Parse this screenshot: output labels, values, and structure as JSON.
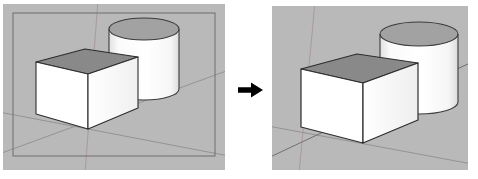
{
  "figure": {
    "kind": "before-after-comparison",
    "arrow_glyph": "→",
    "arrow_label": "right-arrow",
    "arrow_color": "#000000"
  },
  "panels": [
    {
      "id": "before",
      "label": "before",
      "caption": "",
      "background_color": "#b9b9b9",
      "has_perspective_frame": true,
      "frame_color": "#6e6e6e",
      "scene": {
        "axis_lines": [
          {
            "name": "vertical-blue-axis",
            "color": "#a39098"
          },
          {
            "name": "ground-red-axis",
            "color": "#8d8d8d"
          },
          {
            "name": "ground-green-axis",
            "color": "#8d8d8d"
          }
        ],
        "objects": [
          {
            "name": "cylinder",
            "top_face_color": "#a0a0a0",
            "side_face_color": "#fdfdfd",
            "edge_color": "#3a3a3a"
          },
          {
            "name": "box",
            "top_face_color": "#8a8a8a",
            "front_face_color": "#ffffff",
            "side_face_color": "#f2f2f2",
            "edge_color": "#2e2e2e"
          }
        ]
      }
    },
    {
      "id": "after",
      "label": "after",
      "caption": "",
      "background_color": "#b9b9b9",
      "has_perspective_frame": false,
      "frame_color": "#6e6e6e",
      "scene": {
        "axis_lines": [
          {
            "name": "vertical-blue-axis",
            "color": "#a39098"
          },
          {
            "name": "ground-red-axis",
            "color": "#8d8d8d"
          },
          {
            "name": "ground-green-axis",
            "color": "#8d8d8d"
          }
        ],
        "objects": [
          {
            "name": "cylinder",
            "top_face_color": "#a0a0a0",
            "side_face_color": "#fdfdfd",
            "edge_color": "#3a3a3a"
          },
          {
            "name": "box",
            "top_face_color": "#8a8a8a",
            "front_face_color": "#ffffff",
            "side_face_color": "#f2f2f2",
            "edge_color": "#2e2e2e"
          }
        ]
      }
    }
  ]
}
